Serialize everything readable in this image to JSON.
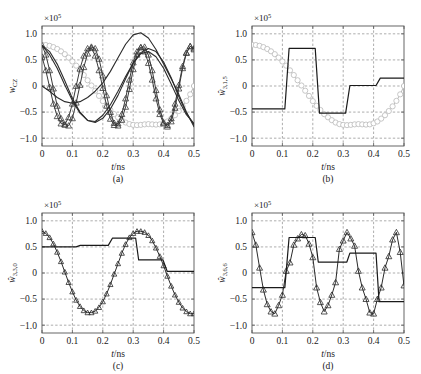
{
  "figure": {
    "panels": [
      {
        "id": "a",
        "caption": "(a)",
        "xlabel": "t/ns",
        "ylabel": "w_CZ",
        "ylabel_text": "wCZ",
        "exponent": "×10",
        "exponent_sup": "5",
        "xticks": [
          "0",
          "0.1",
          "0.2",
          "0.3",
          "0.4",
          "0.5"
        ],
        "yticks": [
          "1.0",
          "0.5",
          "0",
          "−0.5",
          "−1.0"
        ]
      },
      {
        "id": "b",
        "caption": "(b)",
        "xlabel": "t/ns",
        "ylabel": "w̅3,1,5",
        "ylabel_text": "w3,1,5",
        "exponent": "×10",
        "exponent_sup": "5",
        "xticks": [
          "0",
          "0.1",
          "0.2",
          "0.3",
          "0.4",
          "0.5"
        ],
        "yticks": [
          "1.0",
          "0.5",
          "0",
          "−0.5",
          "−1.0"
        ]
      },
      {
        "id": "c",
        "caption": "(c)",
        "xlabel": "t/ns",
        "ylabel": "w̅3,3,0",
        "ylabel_text": "w3,3,0",
        "exponent": "×10",
        "exponent_sup": "5",
        "xticks": [
          "0",
          "0.1",
          "0.2",
          "0.3",
          "0.4",
          "0.5"
        ],
        "yticks": [
          "1.0",
          "0.5",
          "0",
          "−0.5",
          "−1.0"
        ]
      },
      {
        "id": "d",
        "caption": "(d)",
        "xlabel": "t/ns",
        "ylabel": "w̅3,6,6",
        "ylabel_text": "w3,6,6",
        "exponent": "×10",
        "exponent_sup": "5",
        "xticks": [
          "0",
          "0.1",
          "0.2",
          "0.3",
          "0.4",
          "0.5"
        ],
        "yticks": [
          "1.0",
          "0.5",
          "0",
          "−0.5",
          "−1.0"
        ]
      }
    ]
  },
  "chart_data": [
    {
      "type": "line",
      "panel": "a",
      "title": "",
      "xlabel": "t/ns",
      "ylabel": "w_CZ",
      "yscale": 100000.0,
      "xlim": [
        0,
        0.5
      ],
      "ylim": [
        -1.15,
        1.15
      ],
      "grid": true,
      "legend": "none",
      "series": [
        {
          "name": "gray-circle-slow",
          "color": "#b9b9b9",
          "marker": "circle",
          "marker_size": 2.6,
          "linewidth": 1.0,
          "x": [
            0,
            0.0125,
            0.025,
            0.0375,
            0.05,
            0.0625,
            0.075,
            0.0875,
            0.1,
            0.1125,
            0.125,
            0.1375,
            0.15,
            0.1625,
            0.175,
            0.1875,
            0.2,
            0.2125,
            0.225,
            0.2375,
            0.25,
            0.2625,
            0.275,
            0.2875,
            0.3,
            0.3125,
            0.325,
            0.3375,
            0.35,
            0.3625,
            0.375,
            0.3875,
            0.4,
            0.4125,
            0.425,
            0.4375,
            0.45,
            0.4625,
            0.475,
            0.4875,
            0.5
          ],
          "y": [
            0.79,
            0.785,
            0.77,
            0.745,
            0.71,
            0.665,
            0.61,
            0.545,
            0.47,
            0.39,
            0.3,
            0.21,
            0.11,
            0.01,
            -0.09,
            -0.19,
            -0.29,
            -0.38,
            -0.46,
            -0.54,
            -0.6,
            -0.655,
            -0.7,
            -0.73,
            -0.745,
            -0.75,
            -0.745,
            -0.735,
            -0.73,
            -0.735,
            -0.74,
            -0.735,
            -0.715,
            -0.68,
            -0.625,
            -0.56,
            -0.48,
            -0.39,
            -0.285,
            -0.16,
            0.0
          ]
        },
        {
          "name": "dark-triangle-fast-1",
          "color": "#3a3a3a",
          "marker": "triangle",
          "marker_size": 3.0,
          "linewidth": 1.0,
          "x": [
            0,
            0.0125,
            0.025,
            0.0375,
            0.05,
            0.0625,
            0.075,
            0.0875,
            0.1,
            0.1125,
            0.125,
            0.1375,
            0.15,
            0.1625,
            0.175,
            0.1875,
            0.2,
            0.2125,
            0.225,
            0.2375,
            0.25,
            0.2625,
            0.275,
            0.2875,
            0.3,
            0.3125,
            0.325,
            0.3375,
            0.35,
            0.3625,
            0.375,
            0.3875,
            0.4,
            0.4125,
            0.425,
            0.4375,
            0.45,
            0.4625,
            0.475,
            0.4875,
            0.5
          ],
          "y": [
            0.78,
            0.6,
            0.3,
            -0.05,
            -0.38,
            -0.62,
            -0.74,
            -0.76,
            -0.62,
            -0.32,
            0.02,
            0.36,
            0.62,
            0.75,
            0.72,
            0.52,
            0.2,
            -0.18,
            -0.5,
            -0.71,
            -0.76,
            -0.65,
            -0.4,
            -0.06,
            0.32,
            0.6,
            0.74,
            0.75,
            0.6,
            0.3,
            -0.08,
            -0.45,
            -0.7,
            -0.78,
            -0.68,
            -0.42,
            -0.05,
            0.34,
            0.63,
            0.76,
            0.72
          ]
        },
        {
          "name": "dark-triangle-fast-2",
          "color": "#3a3a3a",
          "marker": "triangle",
          "marker_size": 3.0,
          "linewidth": 1.0,
          "x": [
            0,
            0.0125,
            0.025,
            0.0375,
            0.05,
            0.0625,
            0.075,
            0.0875,
            0.1,
            0.1125,
            0.125,
            0.1375,
            0.15,
            0.1625,
            0.175,
            0.1875,
            0.2,
            0.2125,
            0.225,
            0.2375,
            0.25,
            0.2625,
            0.275,
            0.2875,
            0.3,
            0.3125,
            0.325,
            0.3375,
            0.35,
            0.3625,
            0.375,
            0.3875,
            0.4,
            0.4125,
            0.425,
            0.4375,
            0.45,
            0.4625,
            0.475,
            0.4875,
            0.5
          ],
          "y": [
            0.56,
            0.3,
            -0.02,
            -0.34,
            -0.58,
            -0.72,
            -0.74,
            -0.6,
            -0.34,
            0.0,
            0.33,
            0.58,
            0.72,
            0.73,
            0.58,
            0.3,
            -0.04,
            -0.38,
            -0.63,
            -0.75,
            -0.72,
            -0.54,
            -0.24,
            0.12,
            0.45,
            0.66,
            0.74,
            0.66,
            0.44,
            0.12,
            -0.24,
            -0.54,
            -0.72,
            -0.75,
            -0.62,
            -0.34,
            0.02,
            0.38,
            0.64,
            0.76,
            0.7
          ]
        },
        {
          "name": "dark-smooth-slow-1",
          "color": "#2b2b2b",
          "marker": "none",
          "marker_size": 0,
          "linewidth": 1.1,
          "x": [
            0,
            0.025,
            0.05,
            0.075,
            0.1,
            0.125,
            0.15,
            0.175,
            0.2,
            0.225,
            0.25,
            0.275,
            0.3,
            0.325,
            0.35,
            0.375,
            0.4,
            0.425,
            0.45,
            0.475,
            0.5
          ],
          "y": [
            0.0,
            -0.1,
            -0.22,
            -0.3,
            -0.33,
            -0.3,
            -0.22,
            -0.1,
            0.06,
            0.28,
            0.54,
            0.8,
            0.98,
            1.02,
            0.92,
            0.7,
            0.42,
            0.14,
            -0.16,
            -0.5,
            -0.78
          ]
        },
        {
          "name": "dark-smooth-slow-2",
          "color": "#2b2b2b",
          "marker": "none",
          "marker_size": 0,
          "linewidth": 1.1,
          "x": [
            0,
            0.025,
            0.05,
            0.075,
            0.1,
            0.125,
            0.15,
            0.175,
            0.2,
            0.225,
            0.25,
            0.275,
            0.3,
            0.325,
            0.35,
            0.375,
            0.4,
            0.425,
            0.45,
            0.475,
            0.5
          ],
          "y": [
            0.78,
            0.66,
            0.42,
            0.1,
            -0.24,
            -0.5,
            -0.66,
            -0.7,
            -0.62,
            -0.44,
            -0.18,
            0.14,
            0.44,
            0.64,
            0.72,
            0.66,
            0.46,
            0.16,
            -0.2,
            -0.52,
            -0.74
          ]
        },
        {
          "name": "dark-smooth-slow-3",
          "color": "#2b2b2b",
          "marker": "none",
          "marker_size": 0,
          "linewidth": 1.1,
          "x": [
            0,
            0.025,
            0.05,
            0.075,
            0.1,
            0.125,
            0.15,
            0.175,
            0.2,
            0.225,
            0.25,
            0.275,
            0.3,
            0.325,
            0.35,
            0.375,
            0.4,
            0.425,
            0.45,
            0.475,
            0.5
          ],
          "y": [
            0.78,
            0.6,
            0.34,
            0.02,
            -0.28,
            -0.52,
            -0.66,
            -0.68,
            -0.56,
            -0.36,
            -0.1,
            0.18,
            0.44,
            0.62,
            0.66,
            0.56,
            0.34,
            0.04,
            -0.28,
            -0.55,
            -0.72
          ]
        }
      ]
    },
    {
      "type": "line",
      "panel": "b",
      "title": "",
      "xlabel": "t/ns",
      "ylabel": "w̅3,1,5",
      "yscale": 100000.0,
      "xlim": [
        0,
        0.5
      ],
      "ylim": [
        -1.15,
        1.15
      ],
      "grid": true,
      "legend": "none",
      "series": [
        {
          "name": "gray-circle-reference",
          "color": "#b9b9b9",
          "marker": "circle",
          "marker_size": 2.6,
          "linewidth": 1.0,
          "x": [
            0,
            0.0125,
            0.025,
            0.0375,
            0.05,
            0.0625,
            0.075,
            0.0875,
            0.1,
            0.1125,
            0.125,
            0.1375,
            0.15,
            0.1625,
            0.175,
            0.1875,
            0.2,
            0.2125,
            0.225,
            0.2375,
            0.25,
            0.2625,
            0.275,
            0.2875,
            0.3,
            0.3125,
            0.325,
            0.3375,
            0.35,
            0.3625,
            0.375,
            0.3875,
            0.4,
            0.4125,
            0.425,
            0.4375,
            0.45,
            0.4625,
            0.475,
            0.4875,
            0.5
          ],
          "y": [
            0.79,
            0.785,
            0.77,
            0.745,
            0.71,
            0.665,
            0.61,
            0.545,
            0.47,
            0.39,
            0.3,
            0.21,
            0.11,
            0.01,
            -0.09,
            -0.19,
            -0.29,
            -0.38,
            -0.46,
            -0.54,
            -0.6,
            -0.655,
            -0.7,
            -0.73,
            -0.745,
            -0.75,
            -0.745,
            -0.735,
            -0.73,
            -0.735,
            -0.74,
            -0.735,
            -0.715,
            -0.68,
            -0.625,
            -0.56,
            -0.48,
            -0.39,
            -0.285,
            -0.16,
            0.0
          ]
        },
        {
          "name": "black-step-control",
          "color": "#1a1a1a",
          "marker": "none",
          "marker_size": 0,
          "linewidth": 1.2,
          "x": [
            0,
            0.1,
            0.108,
            0.122,
            0.2,
            0.208,
            0.222,
            0.3,
            0.308,
            0.322,
            0.4,
            0.408,
            0.422,
            0.5
          ],
          "y": [
            -0.44,
            -0.44,
            -0.44,
            0.72,
            0.72,
            0.72,
            -0.52,
            -0.52,
            -0.52,
            0.01,
            0.01,
            0.01,
            0.15,
            0.15
          ]
        }
      ]
    },
    {
      "type": "line",
      "panel": "c",
      "title": "",
      "xlabel": "t/ns",
      "ylabel": "w̅3,3,0",
      "yscale": 100000.0,
      "xlim": [
        0,
        0.5
      ],
      "ylim": [
        -1.15,
        1.15
      ],
      "grid": true,
      "legend": "none",
      "series": [
        {
          "name": "dark-triangle-cosine",
          "color": "#2b2b2b",
          "marker": "triangle",
          "marker_size": 2.6,
          "linewidth": 1.0,
          "x": [
            0,
            0.0125,
            0.025,
            0.0375,
            0.05,
            0.0625,
            0.075,
            0.0875,
            0.1,
            0.1125,
            0.125,
            0.1375,
            0.15,
            0.1625,
            0.175,
            0.1875,
            0.2,
            0.2125,
            0.225,
            0.2375,
            0.25,
            0.2625,
            0.275,
            0.2875,
            0.3,
            0.3125,
            0.325,
            0.3375,
            0.35,
            0.3625,
            0.375,
            0.3875,
            0.4,
            0.4125,
            0.425,
            0.4375,
            0.45,
            0.4625,
            0.475,
            0.4875,
            0.5
          ],
          "y": [
            0.8,
            0.76,
            0.68,
            0.56,
            0.4,
            0.22,
            0.02,
            -0.18,
            -0.36,
            -0.52,
            -0.64,
            -0.72,
            -0.76,
            -0.76,
            -0.73,
            -0.66,
            -0.55,
            -0.4,
            -0.22,
            -0.02,
            0.18,
            0.38,
            0.55,
            0.68,
            0.76,
            0.8,
            0.8,
            0.78,
            0.72,
            0.62,
            0.48,
            0.32,
            0.14,
            -0.06,
            -0.25,
            -0.42,
            -0.56,
            -0.67,
            -0.74,
            -0.78,
            -0.78
          ]
        },
        {
          "name": "black-step-control",
          "color": "#1a1a1a",
          "marker": "none",
          "marker_size": 0,
          "linewidth": 1.2,
          "x": [
            0,
            0.1,
            0.112,
            0.126,
            0.21,
            0.218,
            0.232,
            0.3,
            0.308,
            0.318,
            0.39,
            0.398,
            0.412,
            0.5
          ],
          "y": [
            0.5,
            0.5,
            0.5,
            0.53,
            0.53,
            0.53,
            0.67,
            0.67,
            0.67,
            0.25,
            0.25,
            0.25,
            0.03,
            0.03
          ]
        }
      ]
    },
    {
      "type": "line",
      "panel": "d",
      "title": "",
      "xlabel": "t/ns",
      "ylabel": "w̅3,6,6",
      "yscale": 100000.0,
      "xlim": [
        0,
        0.5
      ],
      "ylim": [
        -1.15,
        1.15
      ],
      "grid": true,
      "legend": "none",
      "series": [
        {
          "name": "dark-triangle-oscillation",
          "color": "#2b2b2b",
          "marker": "triangle",
          "marker_size": 3.0,
          "linewidth": 1.0,
          "x": [
            0,
            0.0125,
            0.025,
            0.0375,
            0.05,
            0.0625,
            0.075,
            0.0875,
            0.1,
            0.1125,
            0.125,
            0.1375,
            0.15,
            0.1625,
            0.175,
            0.1875,
            0.2,
            0.2125,
            0.225,
            0.2375,
            0.25,
            0.2625,
            0.275,
            0.2875,
            0.3,
            0.3125,
            0.325,
            0.3375,
            0.35,
            0.3625,
            0.375,
            0.3875,
            0.4,
            0.4125,
            0.425,
            0.4375,
            0.45,
            0.4625,
            0.475,
            0.4875,
            0.5
          ],
          "y": [
            0.78,
            0.54,
            0.1,
            -0.32,
            -0.6,
            -0.74,
            -0.78,
            -0.62,
            -0.42,
            0.04,
            0.2,
            0.54,
            0.66,
            0.74,
            0.72,
            0.56,
            0.3,
            -0.28,
            -0.56,
            -0.74,
            -0.62,
            -0.42,
            -0.18,
            0.46,
            0.62,
            0.78,
            0.66,
            0.52,
            0.04,
            -0.28,
            -0.5,
            -0.76,
            -0.78,
            -0.5,
            -0.28,
            0.1,
            0.32,
            0.64,
            0.78,
            0.4,
            -0.24
          ]
        },
        {
          "name": "black-step-control",
          "color": "#1a1a1a",
          "marker": "none",
          "marker_size": 0,
          "linewidth": 1.2,
          "x": [
            0,
            0.1,
            0.108,
            0.122,
            0.2,
            0.208,
            0.218,
            0.305,
            0.312,
            0.322,
            0.4,
            0.408,
            0.418,
            0.5
          ],
          "y": [
            -0.28,
            -0.28,
            -0.28,
            0.68,
            0.68,
            0.68,
            0.21,
            0.21,
            0.21,
            0.38,
            0.38,
            0.38,
            -0.55,
            -0.55
          ]
        }
      ]
    }
  ]
}
